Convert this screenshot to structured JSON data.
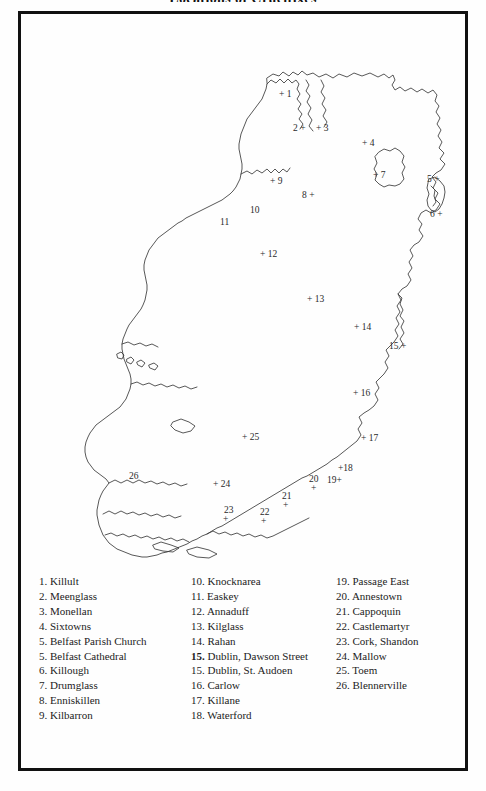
{
  "figure": {
    "title": "Locations of Crucifixes",
    "frame_color": "#111111",
    "map_stroke_color": "#3a3a3a",
    "background_color": "#fefefe"
  },
  "map": {
    "region_name": "Ireland",
    "markers": [
      {
        "num": "1",
        "label": "+ 1",
        "x": 258,
        "y": 76,
        "name": "Killult"
      },
      {
        "num": "2",
        "label": "2 +",
        "x": 278,
        "y": 110,
        "name": "Meenglass"
      },
      {
        "num": "3",
        "label": "+ 3",
        "x": 299,
        "y": 110,
        "name": "Monellan"
      },
      {
        "num": "4",
        "label": "+ 4",
        "x": 341,
        "y": 125,
        "name": "Sixtowns"
      },
      {
        "num": "5",
        "label": "5 +",
        "x": 414,
        "y": 162,
        "name": "Belfast Parish Church"
      },
      {
        "num": "5b",
        "label": "6 +",
        "x": 421,
        "y": 197,
        "name": "Killough"
      },
      {
        "num": "7",
        "label": "+ 7",
        "x": 355,
        "y": 157,
        "name": "Drumglass"
      },
      {
        "num": "8",
        "label": "8 +",
        "x": 285,
        "y": 177,
        "name": "Enniskillen"
      },
      {
        "num": "9",
        "label": "+ 9",
        "x": 252,
        "y": 164,
        "name": "Kilbarron"
      },
      {
        "num": "10",
        "label": "10",
        "x": 232,
        "y": 192,
        "name": "Knocknarea"
      },
      {
        "num": "11",
        "label": "11",
        "x": 200,
        "y": 204,
        "name": "Easkey"
      },
      {
        "num": "12",
        "label": "+ 12",
        "x": 243,
        "y": 237,
        "name": "Annaduff"
      },
      {
        "num": "13",
        "label": "+ 13",
        "x": 289,
        "y": 282,
        "name": "Kilglass"
      },
      {
        "num": "14",
        "label": "+ 14",
        "x": 337,
        "y": 310,
        "name": "Rahan"
      },
      {
        "num": "15",
        "label": "15 +",
        "x": 374,
        "y": 329,
        "name": "Dublin, Dawson Street"
      },
      {
        "num": "16",
        "label": "+ 16",
        "x": 336,
        "y": 376,
        "name": "Carlow"
      },
      {
        "num": "17",
        "label": "+ 17",
        "x": 343,
        "y": 421,
        "name": "Killane"
      },
      {
        "num": "18",
        "label": "+18",
        "x": 320,
        "y": 452,
        "name": "Waterford"
      },
      {
        "num": "19",
        "label": "19+",
        "x": 310,
        "y": 463,
        "name": "Passage East"
      },
      {
        "num": "20",
        "label": "20",
        "x": 291,
        "y": 463,
        "name": "Annestown"
      },
      {
        "num": "21",
        "label": "21",
        "x": 263,
        "y": 479,
        "name": "Cappoquin"
      },
      {
        "num": "22",
        "label": "22",
        "x": 241,
        "y": 495,
        "name": "Castlemartyr"
      },
      {
        "num": "23",
        "label": "23",
        "x": 206,
        "y": 493,
        "name": "Cork, Shandon"
      },
      {
        "num": "24",
        "label": "+ 24",
        "x": 196,
        "y": 467,
        "name": "Mallow"
      },
      {
        "num": "25",
        "label": "+ 25",
        "x": 225,
        "y": 420,
        "name": "Toem"
      },
      {
        "num": "26",
        "label": "26",
        "x": 113,
        "y": 459,
        "name": "Blennerville"
      }
    ],
    "extra_plus_marks": [
      {
        "x": 293,
        "y": 472
      },
      {
        "x": 265,
        "y": 489
      },
      {
        "x": 243,
        "y": 505
      },
      {
        "x": 205,
        "y": 503
      }
    ]
  },
  "legend": {
    "columns": [
      {
        "items": [
          {
            "num": "1.",
            "name": "Killult",
            "bold": false
          },
          {
            "num": "2.",
            "name": "Meenglass",
            "bold": false
          },
          {
            "num": "3.",
            "name": "Monellan",
            "bold": false
          },
          {
            "num": "4.",
            "name": "Sixtowns",
            "bold": false
          },
          {
            "num": "5.",
            "name": "Belfast Parish Church",
            "bold": false
          },
          {
            "num": "5.",
            "name": "Belfast Cathedral",
            "bold": false
          },
          {
            "num": "6.",
            "name": "Killough",
            "bold": false
          },
          {
            "num": "7.",
            "name": "Drumglass",
            "bold": false
          },
          {
            "num": "8.",
            "name": "Enniskillen",
            "bold": false
          },
          {
            "num": "9.",
            "name": "Kilbarron",
            "bold": false
          }
        ]
      },
      {
        "items": [
          {
            "num": "10.",
            "name": "Knocknarea",
            "bold": false
          },
          {
            "num": "11.",
            "name": "Easkey",
            "bold": false
          },
          {
            "num": "12.",
            "name": "Annaduff",
            "bold": false
          },
          {
            "num": "13.",
            "name": "Kilglass",
            "bold": false
          },
          {
            "num": "14.",
            "name": "Rahan",
            "bold": false
          },
          {
            "num": "15.",
            "name": "Dublin, Dawson Street",
            "bold": true
          },
          {
            "num": "15.",
            "name": "Dublin, St. Audoen",
            "bold": false
          },
          {
            "num": "16.",
            "name": "Carlow",
            "bold": false
          },
          {
            "num": "17.",
            "name": "Killane",
            "bold": false
          },
          {
            "num": "18.",
            "name": "Waterford",
            "bold": false
          }
        ]
      },
      {
        "items": [
          {
            "num": "19.",
            "name": "Passage East",
            "bold": false
          },
          {
            "num": "20.",
            "name": "Annestown",
            "bold": false
          },
          {
            "num": "21.",
            "name": "Cappoquin",
            "bold": false
          },
          {
            "num": "22.",
            "name": "Castlemartyr",
            "bold": false
          },
          {
            "num": "23.",
            "name": "Cork, Shandon",
            "bold": false
          },
          {
            "num": "24.",
            "name": "Mallow",
            "bold": false
          },
          {
            "num": "25.",
            "name": "Toem",
            "bold": false
          },
          {
            "num": "26.",
            "name": "Blennerville",
            "bold": false
          }
        ]
      }
    ]
  }
}
